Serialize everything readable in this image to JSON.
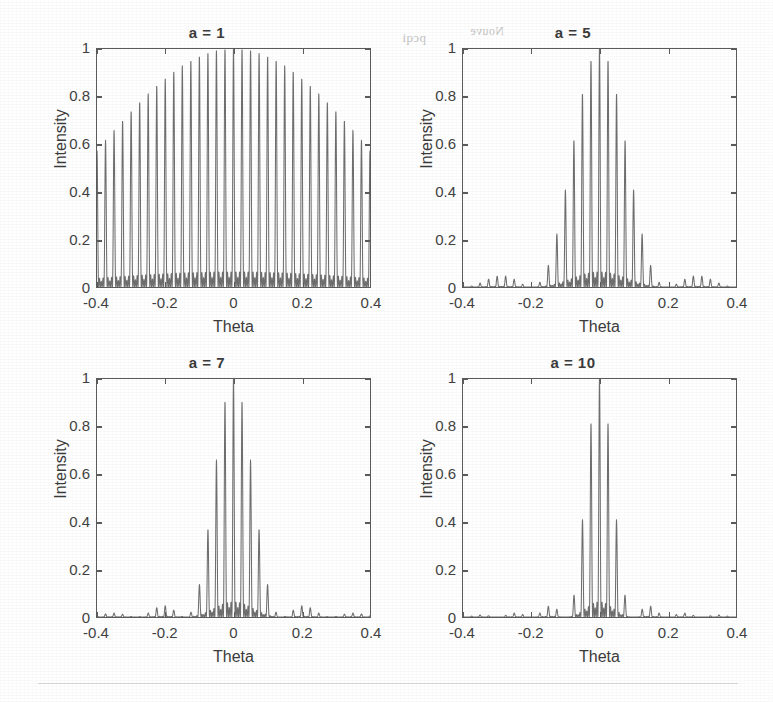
{
  "figure": {
    "background_color": "#ffffff",
    "line_color": "#6e6e6e",
    "axis_color": "#5a5a5a",
    "text_color": "#3a3a3a",
    "panel_titles": [
      "a = 1",
      "a = 5",
      "a = 7",
      "a = 10"
    ],
    "bleed_through": [
      {
        "text": "pcqi",
        "x": 402,
        "y": 30
      },
      {
        "text": "Nouve",
        "x": 455,
        "y": 26
      }
    ]
  },
  "chart_data": [
    {
      "type": "line",
      "title": "a = 1",
      "xlabel": "Theta",
      "ylabel": "Intensity",
      "xlim": [
        -0.4,
        0.4
      ],
      "ylim": [
        0,
        1
      ],
      "xticks": [
        -0.4,
        -0.2,
        0,
        0.2,
        0.4
      ],
      "xticklabels": [
        "-0.4",
        "-0.2",
        "0",
        "0.2",
        "0.4"
      ],
      "yticks": [
        0,
        0.2,
        0.4,
        0.6,
        0.8,
        1
      ],
      "yticklabels": [
        "0",
        "0.2",
        "0.4",
        "0.6",
        "0.8",
        "1"
      ],
      "grid": false,
      "legend": "none",
      "params": {
        "a": 1,
        "N": 5,
        "d": 40,
        "lambda": 1
      },
      "description": "Multi-slit diffraction intensity: broad single-slit envelope of width a=1 modulating closely spaced interference fringes; envelope spans the entire -0.4..0.4 range peaking near theta = 0.",
      "envelope_halfwidth": 1.0,
      "series": [
        {
          "name": "Intensity",
          "peak_envelope_points": [
            {
              "x": -0.4,
              "y": 0.6
            },
            {
              "x": -0.35,
              "y": 0.66
            },
            {
              "x": -0.3,
              "y": 0.73
            },
            {
              "x": -0.25,
              "y": 0.8
            },
            {
              "x": -0.2,
              "y": 0.86
            },
            {
              "x": -0.15,
              "y": 0.92
            },
            {
              "x": -0.1,
              "y": 0.96
            },
            {
              "x": -0.05,
              "y": 0.99
            },
            {
              "x": 0.0,
              "y": 1.0
            },
            {
              "x": 0.05,
              "y": 0.99
            },
            {
              "x": 0.1,
              "y": 0.96
            },
            {
              "x": 0.15,
              "y": 0.92
            },
            {
              "x": 0.2,
              "y": 0.86
            },
            {
              "x": 0.25,
              "y": 0.8
            },
            {
              "x": 0.3,
              "y": 0.73
            },
            {
              "x": 0.35,
              "y": 0.66
            },
            {
              "x": 0.4,
              "y": 0.6
            }
          ]
        }
      ]
    },
    {
      "type": "line",
      "title": "a = 5",
      "xlabel": "Theta",
      "ylabel": "Intensity",
      "xlim": [
        -0.4,
        0.4
      ],
      "ylim": [
        0,
        1
      ],
      "xticks": [
        -0.4,
        -0.2,
        0,
        0.2,
        0.4
      ],
      "xticklabels": [
        "-0.4",
        "-0.2",
        "0",
        "0.2",
        "0.4"
      ],
      "yticks": [
        0,
        0.2,
        0.4,
        0.6,
        0.8,
        1
      ],
      "yticklabels": [
        "0",
        "0.2",
        "0.4",
        "0.6",
        "0.8",
        "1"
      ],
      "grid": false,
      "legend": "none",
      "params": {
        "a": 5,
        "N": 5,
        "d": 40,
        "lambda": 1
      },
      "description": "Envelope narrows to roughly |theta| < 0.2 with a main lobe of tall fringes and small side-lobe ripples out to +/-0.4.",
      "envelope_halfwidth": 0.2,
      "series": [
        {
          "name": "Intensity",
          "peak_envelope_points": [
            {
              "x": -0.4,
              "y": 0.03
            },
            {
              "x": -0.35,
              "y": 0.04
            },
            {
              "x": -0.3,
              "y": 0.03
            },
            {
              "x": -0.25,
              "y": 0.02
            },
            {
              "x": -0.2,
              "y": 0.04
            },
            {
              "x": -0.17,
              "y": 0.14
            },
            {
              "x": -0.14,
              "y": 0.32
            },
            {
              "x": -0.12,
              "y": 0.5
            },
            {
              "x": -0.09,
              "y": 0.7
            },
            {
              "x": -0.06,
              "y": 0.87
            },
            {
              "x": -0.03,
              "y": 0.96
            },
            {
              "x": 0.0,
              "y": 1.0
            },
            {
              "x": 0.03,
              "y": 0.96
            },
            {
              "x": 0.06,
              "y": 0.87
            },
            {
              "x": 0.09,
              "y": 0.7
            },
            {
              "x": 0.12,
              "y": 0.5
            },
            {
              "x": 0.14,
              "y": 0.32
            },
            {
              "x": 0.17,
              "y": 0.14
            },
            {
              "x": 0.2,
              "y": 0.04
            },
            {
              "x": 0.25,
              "y": 0.02
            },
            {
              "x": 0.3,
              "y": 0.03
            },
            {
              "x": 0.35,
              "y": 0.04
            },
            {
              "x": 0.4,
              "y": 0.03
            }
          ]
        }
      ]
    },
    {
      "type": "line",
      "title": "a = 7",
      "xlabel": "Theta",
      "ylabel": "Intensity",
      "xlim": [
        -0.4,
        0.4
      ],
      "ylim": [
        0,
        1
      ],
      "xticks": [
        -0.4,
        -0.2,
        0,
        0.2,
        0.4
      ],
      "xticklabels": [
        "-0.4",
        "-0.2",
        "0",
        "0.2",
        "0.4"
      ],
      "yticks": [
        0,
        0.2,
        0.4,
        0.6,
        0.8,
        1
      ],
      "yticklabels": [
        "0",
        "0.2",
        "0.4",
        "0.6",
        "0.8",
        "1"
      ],
      "grid": false,
      "legend": "none",
      "params": {
        "a": 7,
        "N": 5,
        "d": 40,
        "lambda": 1
      },
      "description": "Envelope narrows further to roughly |theta| < 0.14; main lobe of tall fringes with faint side lobes near +/-0.2 and +/-0.3.",
      "envelope_halfwidth": 0.143,
      "series": [
        {
          "name": "Intensity",
          "peak_envelope_points": [
            {
              "x": -0.4,
              "y": 0.01
            },
            {
              "x": -0.34,
              "y": 0.03
            },
            {
              "x": -0.28,
              "y": 0.04
            },
            {
              "x": -0.22,
              "y": 0.03
            },
            {
              "x": -0.16,
              "y": 0.04
            },
            {
              "x": -0.12,
              "y": 0.13
            },
            {
              "x": -0.1,
              "y": 0.3
            },
            {
              "x": -0.08,
              "y": 0.52
            },
            {
              "x": -0.06,
              "y": 0.74
            },
            {
              "x": -0.04,
              "y": 0.9
            },
            {
              "x": -0.02,
              "y": 0.97
            },
            {
              "x": 0.0,
              "y": 1.0
            },
            {
              "x": 0.02,
              "y": 0.97
            },
            {
              "x": 0.04,
              "y": 0.9
            },
            {
              "x": 0.06,
              "y": 0.74
            },
            {
              "x": 0.08,
              "y": 0.52
            },
            {
              "x": 0.1,
              "y": 0.3
            },
            {
              "x": 0.12,
              "y": 0.13
            },
            {
              "x": 0.16,
              "y": 0.04
            },
            {
              "x": 0.22,
              "y": 0.03
            },
            {
              "x": 0.28,
              "y": 0.04
            },
            {
              "x": 0.34,
              "y": 0.03
            },
            {
              "x": 0.4,
              "y": 0.01
            }
          ]
        }
      ]
    },
    {
      "type": "line",
      "title": "a = 10",
      "xlabel": "Theta",
      "ylabel": "Intensity",
      "xlim": [
        -0.4,
        0.4
      ],
      "ylim": [
        0,
        1
      ],
      "xticks": [
        -0.4,
        -0.2,
        0,
        0.2,
        0.4
      ],
      "xticklabels": [
        "-0.4",
        "-0.2",
        "0",
        "0.2",
        "0.4"
      ],
      "yticks": [
        0,
        0.2,
        0.4,
        0.6,
        0.8,
        1
      ],
      "yticklabels": [
        "0",
        "0.2",
        "0.4",
        "0.6",
        "0.8",
        "1"
      ],
      "grid": false,
      "legend": "none",
      "params": {
        "a": 10,
        "N": 5,
        "d": 40,
        "lambda": 1
      },
      "description": "Narrowest envelope, |theta| < 0.1; a single tall sharp cluster of fringes at theta = 0 with low side lobes near +/-0.15 and +/-0.25.",
      "envelope_halfwidth": 0.1,
      "series": [
        {
          "name": "Intensity",
          "peak_envelope_points": [
            {
              "x": -0.4,
              "y": 0.01
            },
            {
              "x": -0.33,
              "y": 0.02
            },
            {
              "x": -0.26,
              "y": 0.03
            },
            {
              "x": -0.2,
              "y": 0.02
            },
            {
              "x": -0.15,
              "y": 0.05
            },
            {
              "x": -0.11,
              "y": 0.05
            },
            {
              "x": -0.08,
              "y": 0.25
            },
            {
              "x": -0.06,
              "y": 0.57
            },
            {
              "x": -0.04,
              "y": 0.8
            },
            {
              "x": -0.02,
              "y": 0.95
            },
            {
              "x": 0.0,
              "y": 1.0
            },
            {
              "x": 0.02,
              "y": 0.95
            },
            {
              "x": 0.04,
              "y": 0.8
            },
            {
              "x": 0.06,
              "y": 0.57
            },
            {
              "x": 0.08,
              "y": 0.25
            },
            {
              "x": 0.11,
              "y": 0.05
            },
            {
              "x": 0.15,
              "y": 0.05
            },
            {
              "x": 0.2,
              "y": 0.02
            },
            {
              "x": 0.26,
              "y": 0.03
            },
            {
              "x": 0.33,
              "y": 0.02
            },
            {
              "x": 0.4,
              "y": 0.01
            }
          ]
        }
      ]
    }
  ]
}
